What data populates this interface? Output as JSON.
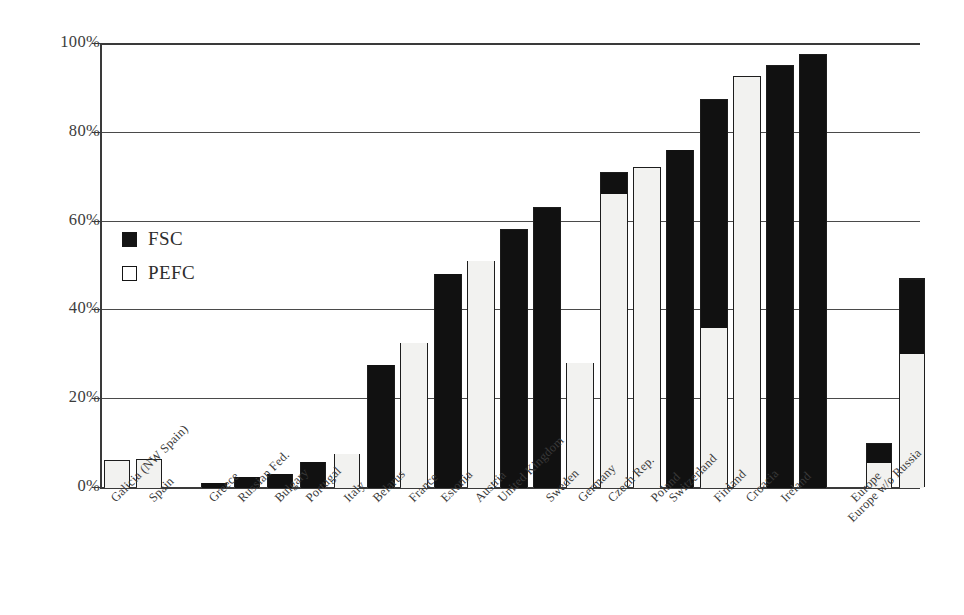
{
  "chart_data": {
    "type": "bar",
    "title": "",
    "subtitle": "",
    "xlabel": "",
    "ylabel": "",
    "ylim": [
      0,
      100
    ],
    "ytick_values": [
      0,
      20,
      40,
      60,
      80,
      100
    ],
    "ytick_labels": [
      "0%",
      "20%",
      "40%",
      "60%",
      "80%",
      "100%"
    ],
    "grid": "horizontal",
    "legend_position": "inside-upper-left",
    "stacked": true,
    "value_unit": "%",
    "legend": [
      {
        "name": "FSC",
        "key": "FSC",
        "color": "#111111",
        "swatch": "filled-square"
      },
      {
        "name": "PEFC",
        "key": "PEFC",
        "color": "#f2f2f0",
        "swatch": "outlined-square"
      }
    ],
    "series": [
      {
        "name": "FSC",
        "values": [
          0,
          0,
          1.0,
          2.3,
          3.0,
          5.7,
          0,
          27.5,
          0,
          48.0,
          0,
          58.0,
          63.0,
          5.0,
          0,
          76.0,
          51.5,
          0,
          95.0,
          97.5,
          4.5,
          17.0
        ]
      },
      {
        "name": "PEFC",
        "values": [
          6.0,
          6.3,
          0,
          0,
          0,
          0,
          7.5,
          0,
          32.5,
          0,
          51.0,
          0,
          28.0,
          66.0,
          72.0,
          0,
          36.0,
          92.5,
          0,
          0,
          5.5,
          30.0
        ]
      }
    ],
    "categories": [
      "Galicia (NW Spain)",
      "Spain",
      "Greece",
      "Russian Fed.",
      "Bulgary",
      "Portugal",
      "Italy",
      "Belarus",
      "France",
      "Estonia",
      "Austria",
      "United Kingdom",
      "Sweden",
      "Germany",
      "Czech Rep.",
      "Poland",
      "Switzerland",
      "Finland",
      "Croacia",
      "Ireland",
      "Europe",
      "Europe w/o Russia"
    ],
    "bars": [
      {
        "category": "Galicia (NW Spain)",
        "x": 104,
        "width": 26,
        "group": 0,
        "segments": [
          {
            "series": "PEFC",
            "from": 0,
            "to": 6.0
          }
        ],
        "total": 6.0
      },
      {
        "category": "Spain",
        "x": 136,
        "width": 26,
        "group": 0,
        "segments": [
          {
            "series": "PEFC",
            "from": 0,
            "to": 6.3
          }
        ],
        "total": 6.3
      },
      {
        "category": "Greece",
        "x": 201,
        "width": 26,
        "group": 1,
        "segments": [
          {
            "series": "FSC",
            "from": 0,
            "to": 1.0
          }
        ],
        "total": 1.0
      },
      {
        "category": "Russian Fed.",
        "x": 234,
        "width": 26,
        "group": 1,
        "segments": [
          {
            "series": "FSC",
            "from": 0,
            "to": 2.3
          }
        ],
        "total": 2.3
      },
      {
        "category": "Bulgary",
        "x": 267,
        "width": 26,
        "group": 1,
        "segments": [
          {
            "series": "FSC",
            "from": 0,
            "to": 3.0
          }
        ],
        "total": 3.0
      },
      {
        "category": "Portugal",
        "x": 300,
        "width": 26,
        "group": 1,
        "segments": [
          {
            "series": "FSC",
            "from": 0,
            "to": 5.7
          }
        ],
        "total": 5.7
      },
      {
        "category": "Italy",
        "x": 334,
        "width": 26,
        "group": 1,
        "segments": [
          {
            "series": "PEFC",
            "from": 0,
            "to": 7.5
          }
        ],
        "total": 7.5
      },
      {
        "category": "Belarus",
        "x": 367,
        "width": 28,
        "group": 1,
        "segments": [
          {
            "series": "FSC",
            "from": 0,
            "to": 27.5
          }
        ],
        "total": 27.5
      },
      {
        "category": "France",
        "x": 400,
        "width": 28,
        "group": 1,
        "segments": [
          {
            "series": "PEFC",
            "from": 0,
            "to": 32.5
          }
        ],
        "total": 32.5
      },
      {
        "category": "Estonia",
        "x": 434,
        "width": 28,
        "group": 1,
        "segments": [
          {
            "series": "FSC",
            "from": 0,
            "to": 48.0
          }
        ],
        "total": 48.0
      },
      {
        "category": "Austria",
        "x": 467,
        "width": 28,
        "group": 1,
        "segments": [
          {
            "series": "PEFC",
            "from": 0,
            "to": 51.0
          }
        ],
        "total": 51.0
      },
      {
        "category": "United Kingdom",
        "x": 500,
        "width": 28,
        "group": 1,
        "segments": [
          {
            "series": "FSC",
            "from": 0,
            "to": 58.0
          }
        ],
        "total": 58.0
      },
      {
        "category": "Sweden",
        "x": 533,
        "width": 28,
        "group": 1,
        "segments": [
          {
            "series": "FSC",
            "from": 0,
            "to": 63.0
          }
        ],
        "total": 63.0
      },
      {
        "category": "Sweden",
        "x": 566,
        "width": 28,
        "group": 1,
        "segments": [
          {
            "series": "PEFC",
            "from": 0,
            "to": 28.0
          }
        ],
        "total": 28.0
      },
      {
        "category": "Germany",
        "x": 600,
        "width": 28,
        "group": 1,
        "segments": [
          {
            "series": "PEFC",
            "from": 0,
            "to": 66.0
          },
          {
            "series": "FSC",
            "from": 66.0,
            "to": 71.0
          }
        ],
        "total": 71.0
      },
      {
        "category": "Czech Rep.",
        "x": 633,
        "width": 28,
        "group": 1,
        "segments": [
          {
            "series": "PEFC",
            "from": 0,
            "to": 72.0
          }
        ],
        "total": 72.0
      },
      {
        "category": "Poland",
        "x": 666,
        "width": 28,
        "group": 1,
        "segments": [
          {
            "series": "FSC",
            "from": 0,
            "to": 76.0
          }
        ],
        "total": 76.0
      },
      {
        "category": "Switzerland",
        "x": 700,
        "width": 28,
        "group": 1,
        "segments": [
          {
            "series": "PEFC",
            "from": 0,
            "to": 36.0
          },
          {
            "series": "FSC",
            "from": 36.0,
            "to": 87.5
          }
        ],
        "total": 87.5
      },
      {
        "category": "Finland",
        "x": 733,
        "width": 28,
        "group": 1,
        "segments": [
          {
            "series": "PEFC",
            "from": 0,
            "to": 92.5
          }
        ],
        "total": 92.5
      },
      {
        "category": "Croacia",
        "x": 766,
        "width": 28,
        "group": 1,
        "segments": [
          {
            "series": "FSC",
            "from": 0,
            "to": 95.0
          }
        ],
        "total": 95.0
      },
      {
        "category": "Ireland",
        "x": 799,
        "width": 28,
        "group": 1,
        "segments": [
          {
            "series": "FSC",
            "from": 0,
            "to": 97.5
          }
        ],
        "total": 97.5
      },
      {
        "category": "Europe",
        "x": 866,
        "width": 26,
        "group": 2,
        "segments": [
          {
            "series": "PEFC",
            "from": 0,
            "to": 5.5
          },
          {
            "series": "FSC",
            "from": 5.5,
            "to": 10.0
          }
        ],
        "total": 10.0
      },
      {
        "category": "Europe w/o Russia",
        "x": 899,
        "width": 26,
        "group": 2,
        "segments": [
          {
            "series": "PEFC",
            "from": 0,
            "to": 30.0
          },
          {
            "series": "FSC",
            "from": 30.0,
            "to": 47.0
          }
        ],
        "total": 47.0
      }
    ],
    "xtick_labels": [
      {
        "text": "Galicia (NW Spain)",
        "x": 108,
        "row": 0
      },
      {
        "text": "Spain",
        "x": 146,
        "row": 0
      },
      {
        "text": "Greece",
        "x": 206,
        "row": 0
      },
      {
        "text": "Russian Fed.",
        "x": 235,
        "row": 0
      },
      {
        "text": "Bulgary",
        "x": 272,
        "row": 0
      },
      {
        "text": "Portugal",
        "x": 303,
        "row": 0
      },
      {
        "text": "Italy",
        "x": 341,
        "row": 0
      },
      {
        "text": "Belarus",
        "x": 370,
        "row": 0
      },
      {
        "text": "France",
        "x": 406,
        "row": 0
      },
      {
        "text": "Estonia",
        "x": 438,
        "row": 0
      },
      {
        "text": "Austria",
        "x": 472,
        "row": 0
      },
      {
        "text": "United Kingdom",
        "x": 495,
        "row": 0
      },
      {
        "text": "Sweden",
        "x": 543,
        "row": 0
      },
      {
        "text": "Germany",
        "x": 575,
        "row": 0
      },
      {
        "text": "Czech Rep.",
        "x": 605,
        "row": 0
      },
      {
        "text": "Poland",
        "x": 648,
        "row": 0
      },
      {
        "text": "Switzerland",
        "x": 666,
        "row": 0
      },
      {
        "text": "Finland",
        "x": 711,
        "row": 0
      },
      {
        "text": "Croacia",
        "x": 743,
        "row": 0
      },
      {
        "text": "Ireland",
        "x": 778,
        "row": 0
      },
      {
        "text": "Europe",
        "x": 848,
        "row": 0
      },
      {
        "text": "Europe w/o Russia",
        "x": 845,
        "row": 1
      }
    ]
  }
}
